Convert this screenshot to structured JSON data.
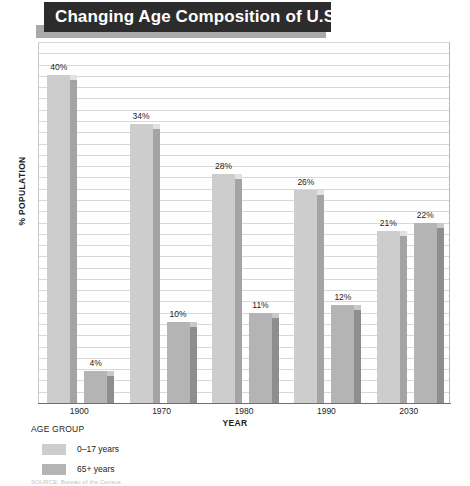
{
  "title": {
    "text": "Changing Age Composition of U.S.",
    "banner_color": "#2c2c2c",
    "shadow_color": "#a9a9a9",
    "text_color": "#ffffff"
  },
  "legend": {
    "heading": "AGE GROUP",
    "entries": [
      {
        "label": "0–17 years",
        "color": "#cdcdcd"
      },
      {
        "label": "65+ years",
        "color": "#b4b4b4"
      }
    ]
  },
  "source": {
    "text": "SOURCE: Bureau of the Census"
  },
  "chart_data": {
    "type": "bar",
    "title": "Changing Age Composition of U.S.",
    "xlabel": "YEAR",
    "ylabel": "% POPULATION",
    "categories": [
      "1900",
      "1970",
      "1980",
      "1990",
      "2030"
    ],
    "series": [
      {
        "name": "0–17 years",
        "color": "#cdcdcd",
        "values": [
          40,
          34,
          28,
          26,
          21
        ]
      },
      {
        "name": "65+ years",
        "color": "#b4b4b4",
        "values": [
          4,
          10,
          11,
          12,
          22
        ]
      }
    ],
    "value_labels": [
      [
        "40%",
        "34%",
        "28%",
        "26%",
        "21%"
      ],
      [
        "4%",
        "10%",
        "11%",
        "12%",
        "22%"
      ]
    ],
    "ylim": [
      0,
      44
    ],
    "grid": true,
    "gridline_count": 32,
    "legend_position": "below-left",
    "unit": "%"
  }
}
